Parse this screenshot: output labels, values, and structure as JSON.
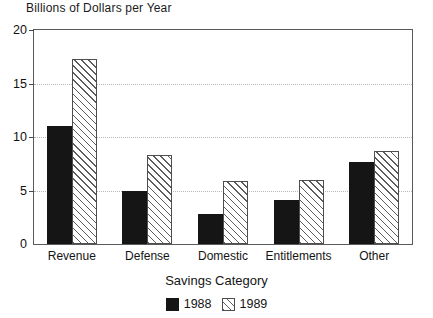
{
  "chart_data": {
    "type": "bar",
    "title": "Billions of Dollars per Year",
    "xlabel": "Savings Category",
    "ylabel": "",
    "categories": [
      "Revenue",
      "Defense",
      "Domestic",
      "Entitlements",
      "Other"
    ],
    "series": [
      {
        "name": "1988",
        "values": [
          11.0,
          5.0,
          2.8,
          4.1,
          7.7
        ],
        "color": "#151515",
        "fill": "solid-black"
      },
      {
        "name": "1989",
        "values": [
          17.3,
          8.3,
          5.9,
          6.0,
          8.7
        ],
        "color": "#5d5d5d",
        "fill": "diagonal-hatch"
      }
    ],
    "ylim": [
      0,
      20
    ],
    "yticks": [
      0,
      5,
      10,
      15,
      20
    ],
    "ytick_labels": [
      "0",
      "5",
      "10",
      "15",
      "20"
    ],
    "grid": true,
    "grid_style": "dotted",
    "grid_color": "#b9b9b9",
    "legend_position": "bottom-center",
    "legend_entries": [
      "1988",
      "1989"
    ],
    "frame": true
  }
}
